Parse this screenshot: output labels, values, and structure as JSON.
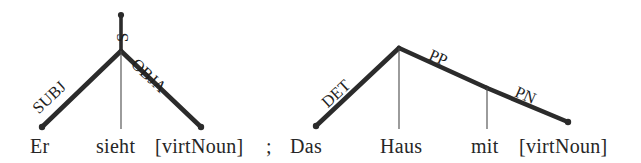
{
  "figure": {
    "kind": "dependency-tree-pair",
    "separator": ";",
    "ink_color": "#262626",
    "background_color": "#ffffff",
    "thick_edge_color": "#2b2b2b",
    "thin_edge_color": "#4a4a4a"
  },
  "trees": [
    {
      "id": "tree-left",
      "root_label": "S",
      "words": [
        {
          "text": "Er",
          "x": 31,
          "y": 138
        },
        {
          "text": "sieht",
          "x": 96,
          "y": 138
        },
        {
          "text": "[virtNoun]",
          "x": 156,
          "y": 138
        }
      ],
      "edges": [
        {
          "label": "SUBJ",
          "from": "sieht",
          "to": "Er",
          "weight": "thick"
        },
        {
          "label": "",
          "from": "sieht",
          "to": "sieht",
          "weight": "thin"
        },
        {
          "label": "OBJA",
          "from": "sieht",
          "to": "[virtNoun]",
          "weight": "thick"
        }
      ]
    },
    {
      "id": "tree-right",
      "root_label": "",
      "words": [
        {
          "text": "Das",
          "x": 291,
          "y": 138
        },
        {
          "text": "Haus",
          "x": 381,
          "y": 138
        },
        {
          "text": "mit",
          "x": 472,
          "y": 138
        },
        {
          "text": "[virtNoun]",
          "x": 520,
          "y": 138
        }
      ],
      "edges": [
        {
          "label": "DET",
          "from": "Haus",
          "to": "Das",
          "weight": "thick"
        },
        {
          "label": "",
          "from": "Haus",
          "to": "Haus",
          "weight": "thin"
        },
        {
          "label": "PP",
          "from": "Haus",
          "to": "mit",
          "weight": "thick"
        },
        {
          "label": "PN",
          "from": "mit",
          "to": "[virtNoun]",
          "weight": "thick"
        }
      ]
    }
  ],
  "labels": {
    "s": "S",
    "subj": "SUBJ",
    "obja": "OBJA",
    "det": "DET",
    "pp": "PP",
    "pn": "PN"
  },
  "words": {
    "er": "Er",
    "sieht": "sieht",
    "virtnoun_left": "[virtNoun]",
    "das": "Das",
    "haus": "Haus",
    "mit": "mit",
    "virtnoun_right": "[virtNoun]"
  },
  "separator": ";"
}
